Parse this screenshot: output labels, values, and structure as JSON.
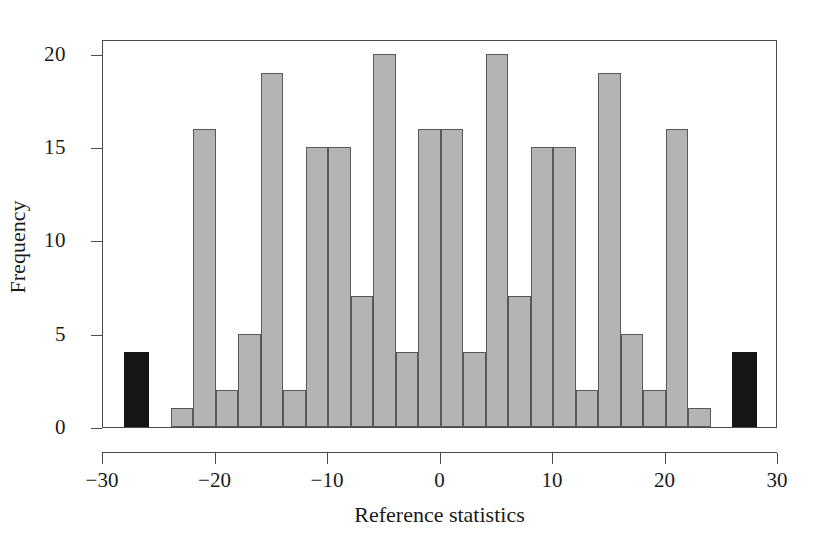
{
  "chart_data": {
    "type": "bar",
    "title": "",
    "subtitle": "",
    "xlabel": "Reference statistics",
    "ylabel": "Frequency",
    "xlim": [
      -30,
      30
    ],
    "ylim": [
      0,
      20.8
    ],
    "grid": false,
    "legend": null,
    "annotations": [],
    "xticks": [
      -30,
      -20,
      -10,
      0,
      10,
      20,
      30
    ],
    "xtick_labels": [
      "−30",
      "−20",
      "−10",
      "0",
      "10",
      "20",
      "30"
    ],
    "yticks": [
      0,
      5,
      10,
      15,
      20
    ],
    "ytick_labels": [
      "0",
      "5",
      "10",
      "15",
      "20"
    ],
    "bin_width": 2,
    "bar_colors": {
      "normal": "#b4b4b4",
      "outlier": "#161616",
      "edge": "#595959"
    },
    "bars": [
      {
        "center": -27,
        "width": 2.2,
        "value": 4,
        "color": "outlier"
      },
      {
        "center": -23,
        "width": 2,
        "value": 1,
        "color": "normal"
      },
      {
        "center": -21,
        "width": 2,
        "value": 16,
        "color": "normal"
      },
      {
        "center": -19,
        "width": 2,
        "value": 2,
        "color": "normal"
      },
      {
        "center": -17,
        "width": 2,
        "value": 5,
        "color": "normal"
      },
      {
        "center": -15,
        "width": 2,
        "value": 19,
        "color": "normal"
      },
      {
        "center": -13,
        "width": 2,
        "value": 2,
        "color": "normal"
      },
      {
        "center": -11,
        "width": 2,
        "value": 15,
        "color": "normal"
      },
      {
        "center": -9,
        "width": 2,
        "value": 15,
        "color": "normal"
      },
      {
        "center": -7,
        "width": 2,
        "value": 7,
        "color": "normal"
      },
      {
        "center": -5,
        "width": 2,
        "value": 20,
        "color": "normal"
      },
      {
        "center": -3,
        "width": 2,
        "value": 4,
        "color": "normal"
      },
      {
        "center": -1,
        "width": 2,
        "value": 16,
        "color": "normal"
      },
      {
        "center": 1,
        "width": 2,
        "value": 16,
        "color": "normal"
      },
      {
        "center": 3,
        "width": 2,
        "value": 4,
        "color": "normal"
      },
      {
        "center": 5,
        "width": 2,
        "value": 20,
        "color": "normal"
      },
      {
        "center": 7,
        "width": 2,
        "value": 7,
        "color": "normal"
      },
      {
        "center": 9,
        "width": 2,
        "value": 15,
        "color": "normal"
      },
      {
        "center": 11,
        "width": 2,
        "value": 15,
        "color": "normal"
      },
      {
        "center": 13,
        "width": 2,
        "value": 2,
        "color": "normal"
      },
      {
        "center": 15,
        "width": 2,
        "value": 19,
        "color": "normal"
      },
      {
        "center": 17,
        "width": 2,
        "value": 5,
        "color": "normal"
      },
      {
        "center": 19,
        "width": 2,
        "value": 2,
        "color": "normal"
      },
      {
        "center": 21,
        "width": 2,
        "value": 16,
        "color": "normal"
      },
      {
        "center": 23,
        "width": 2,
        "value": 1,
        "color": "normal"
      },
      {
        "center": 27,
        "width": 2.2,
        "value": 4,
        "color": "outlier"
      }
    ]
  }
}
